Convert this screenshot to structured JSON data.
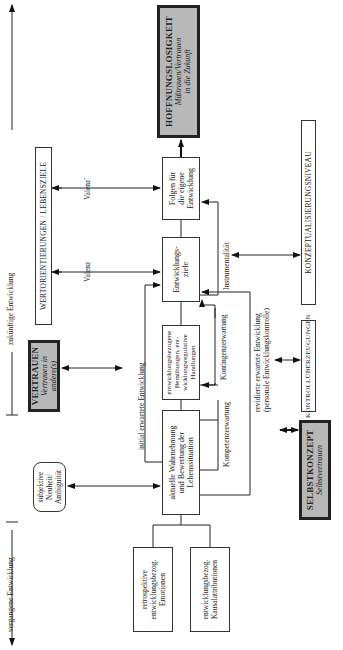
{
  "timeline": {
    "past_label": "vergangene Entwicklung",
    "future_label": "zukünftige Entwicklung"
  },
  "boxes": {
    "hoffnungslosigkeit": {
      "title": "HOFFNUNGSLOSIGKEIT",
      "sub1": "Mißtrauen/Vertrauen",
      "sub2": "in die Zukunft"
    },
    "folgen": {
      "l1": "Folgen für",
      "l2": "die eigene",
      "l3": "Entwicklung"
    },
    "entwicklungsziele": {
      "l1": "Entwicklungs-",
      "l2": "ziele"
    },
    "bemuehungen": {
      "l1": "entwicklungsbezogene",
      "l2": "Bemühungen, ent-",
      "l3": "wicklungsregulative",
      "l4": "Handlungen"
    },
    "wahrnehmung": {
      "l1": "aktuelle Wahrnehmung",
      "l2": "und Bewertung der",
      "l3": "Lebenssituation"
    },
    "retrospektive": {
      "l1": "retrospektive",
      "l2": "entwicklungsbezog.",
      "l3": "Emotionen"
    },
    "kausal": {
      "l1": "entwicklungsbezog.",
      "l2": "Kausalattributionen"
    },
    "wertorientierungen": {
      "title": "WERTORIENTIERUNGEN / LEBENSZIELE"
    },
    "vertrauen": {
      "title": "VERTRAUEN",
      "sub": "Vertrauen in andere(s)"
    },
    "subjektive": {
      "l1": "subjektive",
      "l2": "Neuheit/",
      "l3": "Ambiguität"
    },
    "konzeptualisierung": {
      "title": "KONZEPTUALISIERUNGSNIVEAU"
    },
    "kontrolle": {
      "title": "KONTROLLÜBERZEUGUNGEN"
    },
    "selbstkonzept": {
      "title": "SELBSTKONZEPT",
      "sub": "Selbstvertrauen"
    }
  },
  "edge_labels": {
    "valenz1": "Valenz'",
    "valenz": "Valenz",
    "initial": "initial erwartete Entwicklung",
    "instrumentalitaet": "Instrumentalität",
    "kontingenz": "Kontingenzerwartung",
    "kompetenz": "Kompetenzerwartung",
    "revidiert1": "revidierte erwartete Entwicklung",
    "revidiert2": "(personale Entwicklungskontrolle)"
  }
}
